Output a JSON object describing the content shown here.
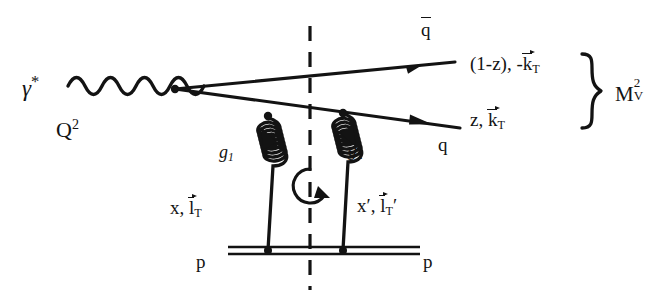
{
  "diagram": {
    "background_color": "#ffffff",
    "ink_color": "#131313",
    "labels": {
      "photon": "γ",
      "photon_star": "*",
      "virtuality": "Q",
      "virtuality_exp": "2",
      "antiquark": "q",
      "antiquark_momentum_fraction": "(1-z), -",
      "antiquark_kt": "k",
      "antiquark_kt_sub": "T",
      "quark": "q",
      "quark_momentum_fraction": "z, ",
      "quark_kt": "k",
      "quark_kt_sub": "T",
      "invariant_mass": "M",
      "invariant_mass_sup": "2",
      "invariant_mass_sub": "V",
      "gluon_1": "g",
      "gluon_1_sub": "1",
      "gluon_2": "g",
      "gluon_2_sub": "2",
      "gluon_1_momentum": "x, ",
      "gluon_1_lt": "l",
      "gluon_1_lt_sub": "T",
      "gluon_2_momentum": "x′, ",
      "gluon_2_lt": "l",
      "gluon_2_lt_sub": "T",
      "gluon_2_lt_prime": "′",
      "proton_left": "p",
      "proton_right": "p"
    },
    "elements": {
      "photon_line": "wavy-photon-propagator",
      "cut_line": "dashed-vertical-cut",
      "loop_arrow": "circular-arrow",
      "gluon_1_coil": "spiral-gluon-left",
      "gluon_2_coil": "spiral-gluon-right",
      "proton_line": "double-horizontal-line",
      "antiquark_line": "straight-fermion-line-leftarrow",
      "quark_line": "straight-fermion-line-rightarrow",
      "brace": "right-curly-brace"
    }
  }
}
